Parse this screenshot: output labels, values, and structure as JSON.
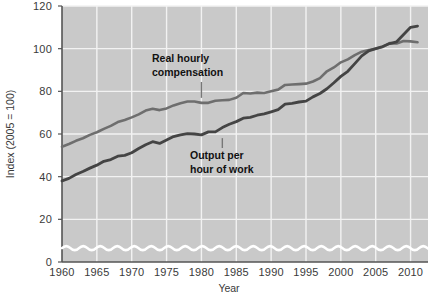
{
  "chart_data": {
    "type": "line",
    "title": "",
    "xlabel": "Year",
    "ylabel": "Index (2005 = 100)",
    "xlim": [
      1960,
      2012.5
    ],
    "ylim": [
      0,
      120
    ],
    "grid": true,
    "legend_position": "inline-annotations",
    "y_ticks": [
      0,
      20,
      40,
      60,
      80,
      100,
      120
    ],
    "x_ticks": [
      1960,
      1965,
      1970,
      1975,
      1980,
      1985,
      1990,
      1995,
      2000,
      2005,
      2010
    ],
    "y_axis_break": true,
    "annotations": [
      {
        "id": "real-hourly-compensation",
        "text_line1": "Real hourly",
        "text_line2": "compensation",
        "points_to_year": 1980,
        "points_to_value": 76
      },
      {
        "id": "output-per-hour-of-work",
        "text_line1": "Output per",
        "text_line2": "hour of work",
        "points_to_year": 1983,
        "points_to_value": 59
      }
    ],
    "x": [
      1960,
      1961,
      1962,
      1963,
      1964,
      1965,
      1966,
      1967,
      1968,
      1969,
      1970,
      1971,
      1972,
      1973,
      1974,
      1975,
      1976,
      1977,
      1978,
      1979,
      1980,
      1981,
      1982,
      1983,
      1984,
      1985,
      1986,
      1987,
      1988,
      1989,
      1990,
      1991,
      1992,
      1993,
      1994,
      1995,
      1996,
      1997,
      1998,
      1999,
      2000,
      2001,
      2002,
      2003,
      2004,
      2005,
      2006,
      2007,
      2008,
      2009,
      2010,
      2011
    ],
    "series": [
      {
        "name": "Real hourly compensation",
        "color": "#6e6e6e",
        "values": [
          54.0,
          55.3,
          56.8,
          58.0,
          59.6,
          60.8,
          62.4,
          63.8,
          65.6,
          66.6,
          67.8,
          69.2,
          71.0,
          71.8,
          71.2,
          72.0,
          73.4,
          74.4,
          75.2,
          75.2,
          74.6,
          74.6,
          75.6,
          75.8,
          76.0,
          77.0,
          79.2,
          79.0,
          79.4,
          79.2,
          80.0,
          80.8,
          83.0,
          83.2,
          83.4,
          83.6,
          84.6,
          86.2,
          89.4,
          91.2,
          93.6,
          95.0,
          97.0,
          98.6,
          99.4,
          100.0,
          100.8,
          102.6,
          102.4,
          103.6,
          103.4,
          103.0
        ]
      },
      {
        "name": "Output per hour of work",
        "color": "#444444",
        "values": [
          38.0,
          39.2,
          41.0,
          42.4,
          44.0,
          45.4,
          47.2,
          48.0,
          49.6,
          50.0,
          51.2,
          53.2,
          55.0,
          56.4,
          55.6,
          57.2,
          58.8,
          59.6,
          60.2,
          60.0,
          59.6,
          61.0,
          61.0,
          63.0,
          64.6,
          65.8,
          67.4,
          67.8,
          68.8,
          69.4,
          70.4,
          71.4,
          74.0,
          74.4,
          75.0,
          75.4,
          77.4,
          79.0,
          81.2,
          84.0,
          87.0,
          89.4,
          93.0,
          96.6,
          99.0,
          100.0,
          101.0,
          102.4,
          103.2,
          106.6,
          110.0,
          110.6
        ]
      }
    ]
  },
  "figure": {
    "plot_background": "#c9c9c9",
    "gridline_color": "#f2f2f2",
    "axis_color": "#555555",
    "page_background": "#ffffff"
  }
}
